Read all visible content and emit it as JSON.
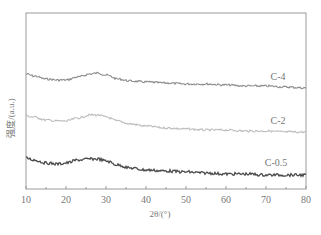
{
  "chart_data": {
    "type": "line",
    "title": "",
    "xlabel": "2θ/(°)",
    "ylabel": "强度/(a.u.)",
    "xlim": [
      10,
      80
    ],
    "x_ticks": [
      10,
      20,
      30,
      40,
      50,
      60,
      70,
      80
    ],
    "y_ticks": [],
    "grid": false,
    "legend_position": "inline-right",
    "series": [
      {
        "name": "C-4",
        "color": "#8c8c8c",
        "x": [
          10,
          12,
          15,
          18,
          20,
          23,
          26,
          28,
          30,
          33,
          36,
          40,
          45,
          50,
          55,
          60,
          65,
          70,
          75,
          80
        ],
        "values": [
          74,
          76,
          79,
          80,
          80,
          77,
          74,
          73,
          75,
          79,
          81,
          82,
          83,
          84,
          84,
          85,
          86,
          86,
          87,
          88
        ]
      },
      {
        "name": "C-2",
        "color": "#bdbdbd",
        "x": [
          10,
          12,
          15,
          18,
          20,
          23,
          26,
          28,
          30,
          33,
          36,
          40,
          45,
          50,
          55,
          60,
          65,
          70,
          75,
          80
        ],
        "values": [
          116,
          117,
          120,
          121,
          121,
          118,
          115,
          115,
          117,
          121,
          124,
          126,
          128,
          129,
          130,
          130,
          131,
          131,
          132,
          132
        ]
      },
      {
        "name": "C-0.5",
        "color": "#4a4a4a",
        "x": [
          10,
          12,
          15,
          18,
          20,
          23,
          26,
          28,
          30,
          33,
          36,
          40,
          45,
          50,
          55,
          60,
          65,
          70,
          75,
          80
        ],
        "values": [
          158,
          160,
          163,
          164,
          163,
          160,
          159,
          159,
          161,
          165,
          168,
          170,
          171,
          172,
          173,
          174,
          174,
          175,
          175,
          175
        ]
      }
    ],
    "series_labels": [
      {
        "text": "C-4",
        "x": 73,
        "y": 80
      },
      {
        "text": "C-2",
        "x": 73,
        "y": 124
      },
      {
        "text": "C-0.5",
        "x": 72.5,
        "y": 166
      }
    ]
  }
}
